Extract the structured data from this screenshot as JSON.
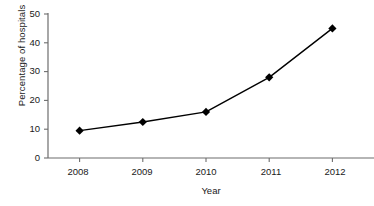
{
  "chart_data": {
    "type": "line",
    "title": "",
    "xlabel": "Year",
    "ylabel": "Percentage of hospitals",
    "categories": [
      "2008",
      "2009",
      "2010",
      "2011",
      "2012"
    ],
    "x": [
      2008,
      2009,
      2010,
      2011,
      2012
    ],
    "values": [
      9.5,
      12.5,
      16,
      28,
      45
    ],
    "series": [
      {
        "name": "Percentage of hospitals",
        "values": [
          9.5,
          12.5,
          16,
          28,
          45
        ]
      }
    ],
    "ylim": [
      0,
      50
    ],
    "yticks": [
      "0",
      "10",
      "20",
      "30",
      "40",
      "50"
    ],
    "ytick_values": [
      0,
      10,
      20,
      30,
      40,
      50
    ],
    "xticks": [
      "2008",
      "2009",
      "2010",
      "2011",
      "2012"
    ],
    "grid": false,
    "legend": false,
    "legend_position": "none",
    "line_color": "#000000",
    "marker": "diamond",
    "marker_color": "#000000",
    "axis_color": "#6d6d6d",
    "background_color": "#ffffff"
  },
  "axes": {
    "y_tick_labels": [
      {
        "label": "50"
      },
      {
        "label": "40"
      },
      {
        "label": "30"
      },
      {
        "label": "20"
      },
      {
        "label": "10"
      },
      {
        "label": "0"
      }
    ],
    "x_tick_labels": [
      {
        "label": "2008"
      },
      {
        "label": "2009"
      },
      {
        "label": "2010"
      },
      {
        "label": "2011"
      },
      {
        "label": "2012"
      }
    ]
  }
}
